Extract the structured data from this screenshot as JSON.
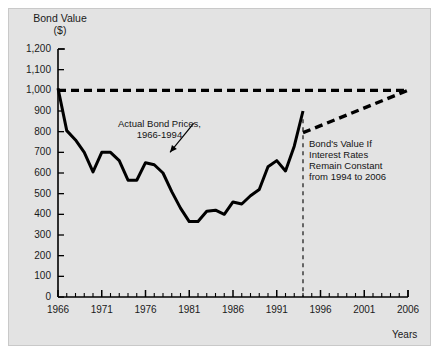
{
  "chart_data": {
    "type": "line",
    "title": "",
    "ylabel": "Bond Value ($)",
    "xlabel": "Years",
    "xlim": [
      1966,
      2006
    ],
    "ylim": [
      0,
      1200
    ],
    "grid": false,
    "legend": "none",
    "y_ticks": [
      "0",
      "100",
      "200",
      "300",
      "400",
      "500",
      "600",
      "700",
      "800",
      "900",
      "1,000",
      "1,100",
      "1,200"
    ],
    "y_tick_values": [
      0,
      100,
      200,
      300,
      400,
      500,
      600,
      700,
      800,
      900,
      1000,
      1100,
      1200
    ],
    "x_ticks": [
      "1966",
      "1971",
      "1976",
      "1981",
      "1986",
      "1991",
      "1996",
      "2001",
      "2006"
    ],
    "x_tick_values": [
      1966,
      1971,
      1976,
      1981,
      1986,
      1991,
      1996,
      2001,
      2006
    ],
    "x_minor_step": 1,
    "series": [
      {
        "name": "Actual Bond Prices, 1966-1994",
        "style": "solid",
        "color": "#000000",
        "x": [
          1966,
          1967,
          1968,
          1969,
          1970,
          1971,
          1972,
          1973,
          1974,
          1975,
          1976,
          1977,
          1978,
          1979,
          1980,
          1981,
          1982,
          1983,
          1984,
          1985,
          1986,
          1987,
          1988,
          1989,
          1990,
          1991,
          1992,
          1993,
          1994
        ],
        "values": [
          1010,
          805,
          760,
          700,
          605,
          700,
          700,
          660,
          565,
          565,
          650,
          640,
          600,
          510,
          430,
          365,
          365,
          415,
          420,
          400,
          460,
          450,
          490,
          520,
          630,
          660,
          610,
          730,
          900
        ]
      },
      {
        "name": "Bond's Value If Interest Rates Remain Constant from 1994 to 2006",
        "style": "dashed",
        "color": "#000000",
        "x": [
          1994,
          2006
        ],
        "values": [
          795,
          1000
        ]
      },
      {
        "name": "Par value reference line",
        "style": "dashed",
        "color": "#000000",
        "x": [
          1966,
          2006
        ],
        "values": [
          1000,
          1000
        ]
      }
    ],
    "drop_line": {
      "name": "year-1994-divider",
      "x": 1994,
      "style": "dashed"
    },
    "annotations": [
      {
        "name": "actual-prices",
        "text": "Actual Bond Prices,\n1966-1994",
        "arrow_from": [
          1981.5,
          840
        ],
        "arrow_to": [
          1978.8,
          700
        ]
      },
      {
        "name": "projection",
        "text": "Bond's Value If\nInterest Rates\nRemain Constant\nfrom 1994 to 2006"
      }
    ]
  },
  "labels": {
    "y_axis_title": "Bond Value\n($)",
    "x_axis_title": "Years",
    "annotation_actual": "Actual Bond Prices,\n1966-1994",
    "annotation_projection": "Bond's Value If\nInterest Rates\nRemain Constant\nfrom 1994 to 2006"
  },
  "colors": {
    "panel_background": "#e3e3e3",
    "line": "#000000",
    "text": "#1a1a1a",
    "page_background": "#ffffff"
  }
}
